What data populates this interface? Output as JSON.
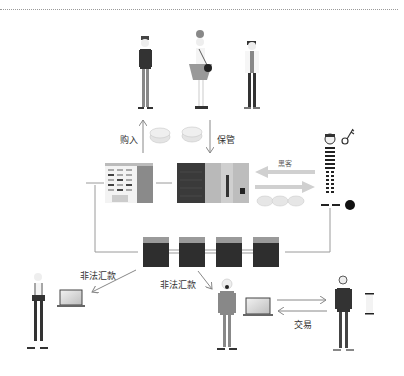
{
  "diagram": {
    "title": "",
    "actors": {
      "top_buyers": [
        "man-in-jacket",
        "woman-with-bag",
        "man-in-white-coat"
      ],
      "hacker": "prisoner-hacker",
      "bottom_left": "person-receiving-funds",
      "bottom_middle": "person-receiving-funds-masked",
      "bottom_right": "trading-partner"
    },
    "labels": {
      "buy": "购入",
      "custody": "保管",
      "hacker": "黑客",
      "illegal_transfer_left": "非法汇款",
      "illegal_transfer_middle": "非法汇款",
      "trade": "交易"
    },
    "nodes": {
      "exchange_building": "exchange-building",
      "server": "server-rack",
      "blockchain": [
        "block-1",
        "block-2",
        "block-3",
        "block-4"
      ],
      "laptops": [
        "laptop-left",
        "laptop-middle"
      ],
      "phone": "phone"
    },
    "colors": {
      "line": "#9a9a9a",
      "arrow_light": "#cfcfcf",
      "dark": "#2d2d2d",
      "mid": "#7a7a7a",
      "light": "#dcdcdc"
    }
  }
}
